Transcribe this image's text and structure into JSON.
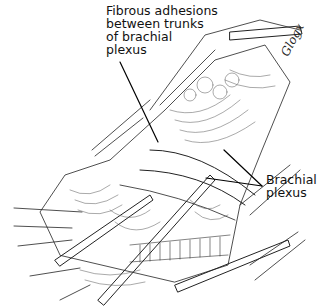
{
  "figure": {
    "type": "surgical line illustration",
    "labels": {
      "top": {
        "lines": [
          "Fibrous adhesions",
          "between trunks",
          "of brachial",
          "plexus"
        ]
      },
      "right": {
        "lines": [
          "Brachial",
          "plexus"
        ]
      }
    },
    "signature": "Glogx",
    "colors": {
      "ink": "#111111",
      "background": "#ffffff"
    }
  }
}
